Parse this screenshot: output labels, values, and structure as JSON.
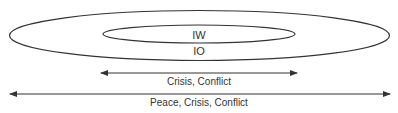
{
  "diagram": {
    "colors": {
      "stroke": "#333333",
      "text": "#333333",
      "background": "#ffffff"
    },
    "ellipses": {
      "outer": {
        "label": "IO"
      },
      "inner": {
        "label": "IW"
      }
    },
    "arrows": {
      "short": {
        "label": "Crisis, Conflict"
      },
      "long": {
        "label": "Peace, Crisis, Conflict"
      }
    }
  }
}
